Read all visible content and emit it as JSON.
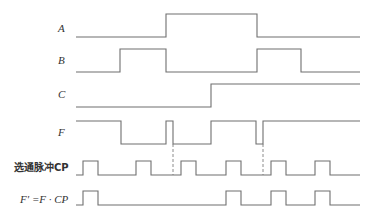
{
  "diagram": {
    "type": "timing-diagram",
    "signals": [
      {
        "id": "A",
        "label": "A",
        "italic": true,
        "label_pos": [
          58,
          32
        ],
        "high_y": 14,
        "low_y": 37,
        "points": "76,37 166,37 166,14 257,14 257,37 360,37"
      },
      {
        "id": "B",
        "label": "B",
        "italic": true,
        "label_pos": [
          58,
          64
        ],
        "high_y": 49,
        "low_y": 72,
        "points": "76,72 120,72 120,49 166,49 166,72 257,72 257,49 301,49 301,72 360,72"
      },
      {
        "id": "C",
        "label": "C",
        "italic": true,
        "label_pos": [
          58,
          98
        ],
        "high_y": 84,
        "low_y": 107,
        "points": "76,107 211,107 211,84 360,84"
      },
      {
        "id": "F",
        "label": "F",
        "italic": true,
        "label_pos": [
          58,
          136
        ],
        "high_y": 121,
        "low_y": 144,
        "points": "76,121 121,121 121,144 166,144 166,121 173,121 173,144 211,144 211,121 256,121 256,144 263,144 263,121 360,121"
      },
      {
        "id": "CP",
        "label": "选通脉冲CP",
        "italic": false,
        "chinese": true,
        "label_pos": [
          14,
          171
        ],
        "high_y": 161,
        "low_y": 175,
        "points": "76,175 83,175 83,161 98,161 98,175 136,175 136,161 151,161 151,175 181,175 181,161 196,161 196,175 226,175 226,161 241,161 241,175 271,175 271,161 286,161 286,175 315,175 315,161 330,161 330,175 360,175"
      },
      {
        "id": "Fprime",
        "label": "F′ =F · CP",
        "italic": true,
        "label_pos": [
          20,
          203
        ],
        "high_y": 191,
        "low_y": 205,
        "points": "76,205 83,205 83,191 98,191 98,205 226,205 226,191 241,191 241,205 271,205 271,191 286,191 286,205 315,205 315,191 330,191 330,205 360,205"
      }
    ],
    "dashed_markers": [
      {
        "x": 173,
        "y1": 144,
        "y2": 175
      },
      {
        "x": 263,
        "y1": 144,
        "y2": 175
      }
    ]
  }
}
